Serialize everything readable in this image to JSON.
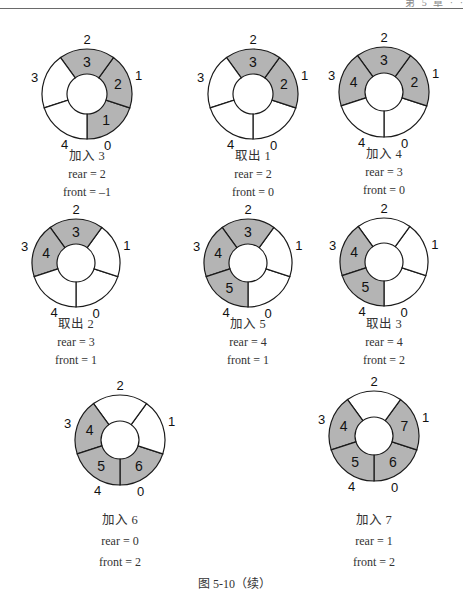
{
  "page_header": {
    "text": "第 5 章 · ·"
  },
  "style": {
    "fill_color": "#b4b4b4",
    "empty_color": "#ffffff",
    "stroke_color": "#1a1a1a"
  },
  "slot_count": 5,
  "diagrams": [
    {
      "id": "add-3",
      "center": [
        87,
        94
      ],
      "outer_r": 45,
      "inner_r": 20,
      "slots": [
        "1",
        "2",
        "3",
        "",
        ""
      ],
      "caption": "加入 3",
      "rear": "rear = 2",
      "front": "front = –1",
      "caption_y": [
        160,
        178,
        196
      ]
    },
    {
      "id": "remove-1",
      "center": [
        253,
        94
      ],
      "outer_r": 45,
      "inner_r": 20,
      "slots": [
        "",
        "2",
        "3",
        "",
        ""
      ],
      "caption": "取出 1",
      "rear": "rear = 2",
      "front": "front = 0",
      "caption_y": [
        160,
        178,
        196
      ]
    },
    {
      "id": "add-4",
      "center": [
        384,
        92
      ],
      "outer_r": 45,
      "inner_r": 19,
      "slots": [
        "",
        "2",
        "3",
        "4",
        ""
      ],
      "caption": "加入 4",
      "rear": "rear = 3",
      "front": "front = 0",
      "caption_y": [
        158,
        176,
        194
      ]
    },
    {
      "id": "remove-2",
      "center": [
        76,
        263
      ],
      "outer_r": 44,
      "inner_r": 19,
      "slots": [
        "",
        "",
        "3",
        "4",
        ""
      ],
      "caption": "取出 2",
      "rear": "rear = 3",
      "front": "front = 1",
      "caption_y": [
        328,
        346,
        364
      ]
    },
    {
      "id": "add-5",
      "center": [
        248,
        263
      ],
      "outer_r": 44,
      "inner_r": 19,
      "slots": [
        "",
        "",
        "3",
        "4",
        "5"
      ],
      "caption": "加入 5",
      "rear": "rear = 4",
      "front": "front = 1",
      "caption_y": [
        328,
        346,
        364
      ]
    },
    {
      "id": "remove-3",
      "center": [
        384,
        262
      ],
      "outer_r": 44,
      "inner_r": 19,
      "slots": [
        "",
        "",
        "",
        "4",
        "5"
      ],
      "caption": "取出 3",
      "rear": "rear = 4",
      "front": "front = 2",
      "caption_y": [
        328,
        346,
        364
      ]
    },
    {
      "id": "add-6",
      "center": [
        120,
        440
      ],
      "outer_r": 45,
      "inner_r": 19,
      "slots": [
        "6",
        "",
        "",
        "4",
        "5"
      ],
      "caption": "加入 6",
      "rear": "rear = 0",
      "front": "front = 2",
      "caption_y": [
        524,
        545,
        566
      ]
    },
    {
      "id": "add-7",
      "center": [
        374,
        436
      ],
      "outer_r": 45,
      "inner_r": 19,
      "slots": [
        "6",
        "7",
        "",
        "4",
        "5"
      ],
      "caption": "加入 7",
      "rear": "rear = 1",
      "front": "front = 2",
      "caption_y": [
        524,
        545,
        566
      ]
    }
  ],
  "figure_caption": "图 5-10（续）"
}
